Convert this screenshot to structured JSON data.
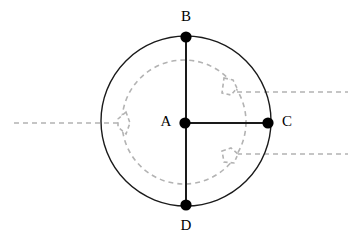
{
  "figure": {
    "title": "",
    "background_color": "#ffffff",
    "width": 357,
    "height": 245,
    "solid_stroke_color": "#1a1a1a",
    "dashed_stroke_color": "#b3b3b3",
    "point_color": "#000000",
    "label_color": "#000000"
  },
  "points": [
    {
      "id": "A",
      "label": "A",
      "cx": 185,
      "cy": 123,
      "r": 5.6,
      "label_x": 166,
      "label_y": 123,
      "label_anchor": "middle",
      "role": "center-point"
    },
    {
      "id": "B",
      "label": "B",
      "cx": 186,
      "cy": 37,
      "r": 5.6,
      "label_x": 186,
      "label_y": 18,
      "label_anchor": "middle",
      "role": "top-point"
    },
    {
      "id": "C",
      "label": "C",
      "cx": 268,
      "cy": 123,
      "r": 5.6,
      "label_x": 287,
      "label_y": 123,
      "label_anchor": "middle",
      "role": "right-point"
    },
    {
      "id": "D",
      "label": "D",
      "cx": 186,
      "cy": 205,
      "r": 5.6,
      "label_x": 186,
      "label_y": 227,
      "label_anchor": "middle",
      "role": "bottom-point"
    }
  ],
  "solid_circle": {
    "cx": 186,
    "cy": 121,
    "r": 85,
    "stroke_width": 1.4
  },
  "dashed_circle": {
    "cx": 184,
    "cy": 122,
    "r": 62,
    "stroke_width": 1.6,
    "dash": "5 4"
  },
  "segments": [
    {
      "id": "BD",
      "x1": 186,
      "y1": 37,
      "x2": 186,
      "y2": 205,
      "stroke_width": 2.0,
      "style": "solid"
    },
    {
      "id": "AC",
      "x1": 185,
      "y1": 123,
      "x2": 268,
      "y2": 123,
      "stroke_width": 2.0,
      "style": "solid"
    }
  ],
  "dashed_rays": [
    {
      "id": "left-ray",
      "x1": 14,
      "y1": 123,
      "x2": 130,
      "y2": 123,
      "stroke_width": 1.6,
      "dash": "5 4"
    },
    {
      "id": "upper-right-ray",
      "x1": 228,
      "y1": 92,
      "x2": 348,
      "y2": 92,
      "stroke_width": 1.6,
      "dash": "5 4"
    },
    {
      "id": "lower-right-ray",
      "x1": 228,
      "y1": 154,
      "x2": 348,
      "y2": 154,
      "stroke_width": 1.6,
      "dash": "5 4"
    }
  ],
  "notches": [
    {
      "id": "left-notch",
      "path": "M 126 112 L 118 119 L 118 127 L 126 134 L 130 123 Z",
      "stroke_width": 1.6,
      "dash": "4 3"
    },
    {
      "id": "upper-right-notch",
      "path": "M 224 78 L 233 80 L 237 88 L 231 95 L 222 93 Z",
      "stroke_width": 1.6,
      "dash": "4 3"
    },
    {
      "id": "lower-right-notch",
      "path": "M 222 151 L 231 148 L 238 154 L 234 163 L 224 162 Z",
      "stroke_width": 1.6,
      "dash": "4 3"
    }
  ],
  "notch_connectors": [
    {
      "id": "left-notch-connector",
      "x1": 130,
      "y1": 123,
      "x2": 122,
      "y2": 123,
      "dash": "4 3"
    },
    {
      "id": "upper-right-notch-connector",
      "x1": 231,
      "y1": 92,
      "x2": 224,
      "y2": 86,
      "dash": "4 3"
    },
    {
      "id": "lower-right-notch-connector",
      "x1": 230,
      "y1": 154,
      "x2": 224,
      "y2": 159,
      "dash": "4 3"
    }
  ]
}
